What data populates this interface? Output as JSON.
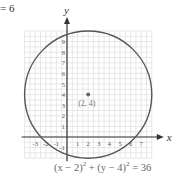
{
  "header": {
    "partial_equation": "= 6"
  },
  "chart_data": {
    "type": "scatter",
    "title": "",
    "xlabel": "x",
    "ylabel": "y",
    "xlim": [
      -4,
      8
    ],
    "ylim": [
      -2,
      10
    ],
    "grid": true,
    "x_ticks": [
      -3,
      -2,
      -1,
      1,
      2,
      3,
      4,
      5,
      6,
      7
    ],
    "y_ticks": [
      -1,
      1,
      2,
      3,
      4,
      5,
      6,
      7,
      8,
      9
    ],
    "circle": {
      "center": [
        2,
        4
      ],
      "radius": 6
    },
    "points": [
      {
        "x": 2,
        "y": 4,
        "label": "(2, 4)"
      }
    ],
    "equation_label": "(x − 2)² + (y − 4)² = 36"
  },
  "caption": {
    "part1": "(x − 2)",
    "exp1": "2",
    "part2": " + (y − 4)",
    "exp2": "2",
    "part3": " = 36"
  },
  "point_label": "(2, 4)",
  "axis": {
    "x": "x",
    "y": "y"
  },
  "colors": {
    "circle": "#555555",
    "grid": "#d9d9d9",
    "axis": "#333333",
    "point": "#666666",
    "label": "#777777"
  }
}
